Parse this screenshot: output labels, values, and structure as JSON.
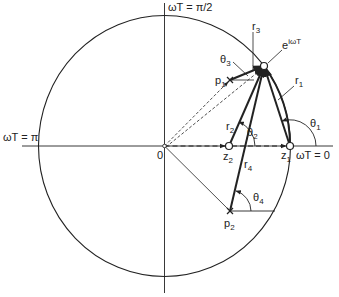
{
  "labels": {
    "axis_top": "ωT = π/2",
    "axis_left": "ωT = π",
    "axis_right": "ωT = 0",
    "origin": "0",
    "point_e_base": "e",
    "point_e_exp": "iωT",
    "p1_base": "p",
    "p1_sub": "1",
    "p2_base": "p",
    "p2_sub": "2",
    "z1_base": "z",
    "z1_sub": "1",
    "z2_base": "z",
    "z2_sub": "2",
    "r1_base": "r",
    "r1_sub": "1",
    "r2_base": "r",
    "r2_sub": "2",
    "r3_base": "r",
    "r3_sub": "3",
    "r4_base": "r",
    "r4_sub": "4",
    "t1_base": "θ",
    "t1_sub": "1",
    "t2_base": "θ",
    "t2_sub": "2",
    "t3_base": "θ",
    "t3_sub": "3",
    "t4_base": "θ",
    "t4_sub": "4"
  },
  "colors": {
    "line": "#222222",
    "background": "#ffffff"
  }
}
